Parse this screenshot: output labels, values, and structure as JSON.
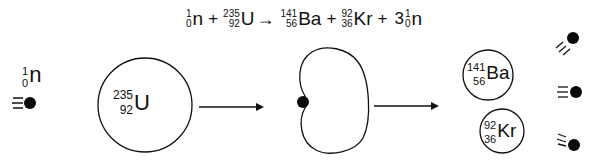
{
  "equation": {
    "reactant_neutron": {
      "mass": "1",
      "atomic": "0",
      "symbol": "n"
    },
    "plus1": "+",
    "reactant_uranium": {
      "mass": "235",
      "atomic": "92",
      "symbol": "U"
    },
    "arrow": "→",
    "product_barium": {
      "mass": "141",
      "atomic": "56",
      "symbol": "Ba"
    },
    "plus2": "+",
    "product_krypton": {
      "mass": "92",
      "atomic": "36",
      "symbol": "Kr"
    },
    "plus3": "+",
    "neutron_coefficient": "3",
    "product_neutron": {
      "mass": "1",
      "atomic": "0",
      "symbol": "n"
    }
  },
  "incoming_neutron": {
    "mass": "1",
    "atomic": "0",
    "symbol": "n"
  },
  "uranium_nucleus": {
    "mass": "235",
    "atomic": "92",
    "symbol": "U"
  },
  "barium_nucleus": {
    "mass": "141",
    "atomic": "56",
    "symbol": "Ba"
  },
  "krypton_nucleus": {
    "mass": "92",
    "atomic": "36",
    "symbol": "Kr"
  },
  "stages": [
    "neutron approaches U-235",
    "compound nucleus deforms",
    "fission into Ba-141, Kr-92 and 3 neutrons"
  ],
  "colors": {
    "line": "#111111",
    "neutron": "#0a0a0a",
    "background": "#ffffff"
  }
}
